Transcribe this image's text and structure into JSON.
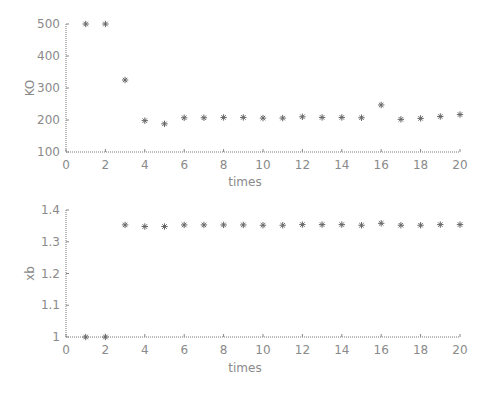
{
  "chart_data": [
    {
      "type": "scatter",
      "title": "",
      "xlabel": "times",
      "ylabel": "KO",
      "xlim": [
        0,
        20
      ],
      "ylim": [
        100,
        500
      ],
      "xticks": [
        0,
        2,
        4,
        6,
        8,
        10,
        12,
        14,
        16,
        18,
        20
      ],
      "yticks": [
        100,
        200,
        300,
        400,
        500
      ],
      "grid": false,
      "marker": "*",
      "x": [
        1,
        2,
        3,
        4,
        5,
        6,
        7,
        8,
        9,
        10,
        11,
        12,
        13,
        14,
        15,
        16,
        17,
        18,
        19,
        20
      ],
      "y": [
        500,
        500,
        325,
        198,
        188,
        207,
        207,
        208,
        208,
        206,
        206,
        210,
        208,
        208,
        207,
        247,
        202,
        205,
        211,
        217
      ]
    },
    {
      "type": "scatter",
      "title": "",
      "xlabel": "times",
      "ylabel": "xb",
      "xlim": [
        0,
        20
      ],
      "ylim": [
        1,
        1.4
      ],
      "xticks": [
        0,
        2,
        4,
        6,
        8,
        10,
        12,
        14,
        16,
        18,
        20
      ],
      "yticks": [
        1,
        1.1,
        1.2,
        1.3,
        1.4
      ],
      "ytick_labels": [
        "1",
        "1.1",
        "1.2",
        "1.3",
        "1.4"
      ],
      "grid": false,
      "marker": "*",
      "x": [
        1,
        2,
        3,
        4,
        5,
        6,
        7,
        8,
        9,
        10,
        11,
        12,
        13,
        14,
        15,
        16,
        17,
        18,
        19,
        20
      ],
      "y": [
        1.0,
        1.0,
        1.353,
        1.348,
        1.348,
        1.353,
        1.353,
        1.353,
        1.353,
        1.352,
        1.352,
        1.354,
        1.354,
        1.354,
        1.352,
        1.358,
        1.352,
        1.352,
        1.354,
        1.354
      ]
    }
  ]
}
